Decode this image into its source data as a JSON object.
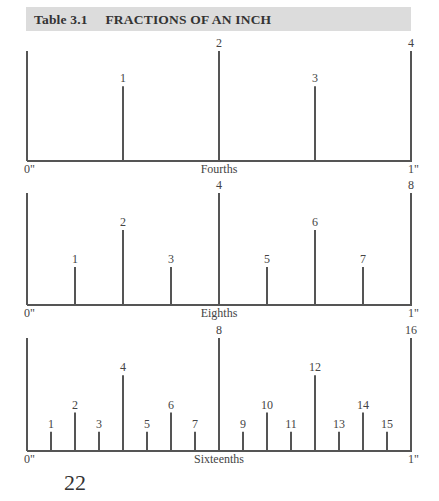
{
  "header": {
    "table_number": "Table 3.1",
    "title": "FRACTIONS OF AN INCH"
  },
  "rulers": [
    {
      "name": "Fourths",
      "start_label": "0\"",
      "end_label": "1\"",
      "divisions": 4,
      "ticks": [
        {
          "label": "1",
          "pos": 1,
          "level": 1
        },
        {
          "label": "2",
          "pos": 2,
          "level": 0
        },
        {
          "label": "3",
          "pos": 3,
          "level": 1
        },
        {
          "label": "4",
          "pos": 4,
          "level": 0
        }
      ]
    },
    {
      "name": "Eighths",
      "start_label": "0\"",
      "end_label": "1\"",
      "divisions": 8,
      "ticks": [
        {
          "label": "1",
          "pos": 1,
          "level": 2
        },
        {
          "label": "2",
          "pos": 2,
          "level": 1
        },
        {
          "label": "3",
          "pos": 3,
          "level": 2
        },
        {
          "label": "4",
          "pos": 4,
          "level": 0
        },
        {
          "label": "5",
          "pos": 5,
          "level": 2
        },
        {
          "label": "6",
          "pos": 6,
          "level": 1
        },
        {
          "label": "7",
          "pos": 7,
          "level": 2
        },
        {
          "label": "8",
          "pos": 8,
          "level": 0
        }
      ]
    },
    {
      "name": "Sixteenths",
      "start_label": "0\"",
      "end_label": "1\"",
      "divisions": 16,
      "ticks": [
        {
          "label": "1",
          "pos": 1,
          "level": 3
        },
        {
          "label": "2",
          "pos": 2,
          "level": 2
        },
        {
          "label": "3",
          "pos": 3,
          "level": 3
        },
        {
          "label": "4",
          "pos": 4,
          "level": 1
        },
        {
          "label": "5",
          "pos": 5,
          "level": 3
        },
        {
          "label": "6",
          "pos": 6,
          "level": 2
        },
        {
          "label": "7",
          "pos": 7,
          "level": 3
        },
        {
          "label": "8",
          "pos": 8,
          "level": 0
        },
        {
          "label": "9",
          "pos": 9,
          "level": 3
        },
        {
          "label": "10",
          "pos": 10,
          "level": 2
        },
        {
          "label": "11",
          "pos": 11,
          "level": 3
        },
        {
          "label": "12",
          "pos": 12,
          "level": 1
        },
        {
          "label": "13",
          "pos": 13,
          "level": 3
        },
        {
          "label": "14",
          "pos": 14,
          "level": 2
        },
        {
          "label": "15",
          "pos": 15,
          "level": 3
        },
        {
          "label": "16",
          "pos": 16,
          "level": 0
        }
      ]
    }
  ],
  "page_number": "22",
  "colors": {
    "header_bg": "#dcdcdc",
    "line": "#555555",
    "text": "#333333"
  }
}
